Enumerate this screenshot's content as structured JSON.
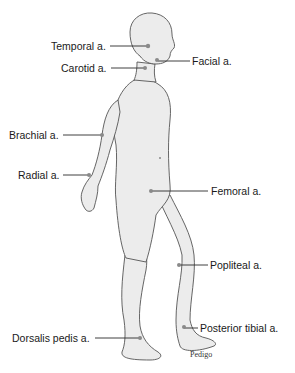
{
  "diagram": {
    "labels": {
      "temporal": "Temporal a.",
      "carotid": "Carotid a.",
      "facial": "Facial a.",
      "brachial": "Brachial a.",
      "radial": "Radial a.",
      "femoral": "Femoral a.",
      "popliteal": "Popliteal a.",
      "posterior_tibial": "Posterior tibial a.",
      "dorsalis_pedis": "Dorsalis pedis a."
    },
    "credit": "Pedigo",
    "colors": {
      "body_fill": "#ececec",
      "outline": "#555555",
      "leader_line": "#2a2a2a",
      "pulse_dot": "#8a8a8a"
    }
  }
}
